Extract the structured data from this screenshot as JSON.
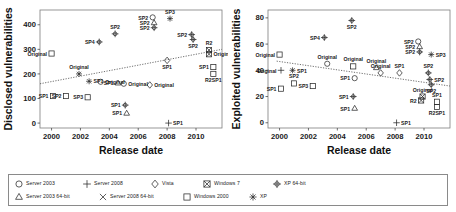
{
  "figure": {
    "panels": [
      {
        "id": "disclosed",
        "ylabel": "Disclosed vulnerabilities",
        "xlabel": "Release date",
        "xticks": [
          "2000",
          "2002",
          "2004",
          "2006",
          "2008",
          "2010"
        ],
        "yticks": [
          "0",
          "100",
          "200",
          "300",
          "400"
        ]
      },
      {
        "id": "exploited",
        "ylabel": "Exploited vulnerabilities",
        "xlabel": "Release date",
        "xticks": [
          "2000",
          "2002",
          "2004",
          "2006",
          "2008",
          "2010"
        ],
        "yticks": [
          "0",
          "20",
          "40",
          "60",
          "80"
        ]
      }
    ]
  },
  "legend": {
    "rows": [
      [
        {
          "label": "Server 2003",
          "marker": "circle"
        },
        {
          "label": "Server 2008",
          "marker": "plus"
        },
        {
          "label": "Vista",
          "marker": "diamond"
        },
        {
          "label": "Windows 7",
          "marker": "squarex"
        },
        {
          "label": "XP 64-bit",
          "marker": "circleplus"
        }
      ],
      [
        {
          "label": "Server 2003 64-bit",
          "marker": "triangle"
        },
        {
          "label": "Server 2008 64-bit",
          "marker": "cross"
        },
        {
          "label": "Windows 2000",
          "marker": "square"
        },
        {
          "label": "XP",
          "marker": "asterisk"
        }
      ]
    ]
  },
  "chart_data": [
    {
      "type": "scatter",
      "title": "",
      "xlabel": "Release date",
      "ylabel": "Disclosed vulnerabilities",
      "xlim": [
        1999.2,
        2011.8
      ],
      "ylim": [
        -20,
        460
      ],
      "grid": false,
      "legend_position": "below-figure",
      "trendline": {
        "x": [
          1999.2,
          2011.8
        ],
        "y": [
          160,
          300
        ],
        "style": "dotted"
      },
      "points": [
        {
          "x": 2000.0,
          "y": 283,
          "marker": "square",
          "label": "Original",
          "label_pos": "left"
        },
        {
          "x": 2001.9,
          "y": 200,
          "marker": "asterisk",
          "label": "Original",
          "label_pos": "above"
        },
        {
          "x": 2000.1,
          "y": 110,
          "marker": "square",
          "label": "SP1",
          "label_pos": "left"
        },
        {
          "x": 2001.0,
          "y": 110,
          "marker": "square",
          "label": "SP2",
          "label_pos": "left"
        },
        {
          "x": 2002.6,
          "y": 170,
          "marker": "asterisk",
          "label": "SP1",
          "label_pos": "right"
        },
        {
          "x": 2002.5,
          "y": 105,
          "marker": "square",
          "label": "SP3",
          "label_pos": "left"
        },
        {
          "x": 2003.4,
          "y": 168,
          "marker": "circle",
          "label": "Original",
          "label_pos": "right"
        },
        {
          "x": 2003.3,
          "y": 330,
          "marker": "circleplus",
          "label": "SP4",
          "label_pos": "left"
        },
        {
          "x": 2004.4,
          "y": 363,
          "marker": "circleplus",
          "label": "SP2",
          "label_pos": "above"
        },
        {
          "x": 2004.6,
          "y": 163,
          "marker": "triangle",
          "label": "SP1",
          "label_pos": "left"
        },
        {
          "x": 2005.0,
          "y": 160,
          "marker": "circle",
          "label": "Original",
          "label_pos": "right"
        },
        {
          "x": 2005.1,
          "y": 73,
          "marker": "circleplus",
          "label": "SP1",
          "label_pos": "left"
        },
        {
          "x": 2005.2,
          "y": 40,
          "marker": "triangle",
          "label": "SP1",
          "label_pos": "left"
        },
        {
          "x": 2006.8,
          "y": 155,
          "marker": "diamond",
          "label": "Original",
          "label_pos": "right"
        },
        {
          "x": 2007.0,
          "y": 430,
          "marker": "circle",
          "label": "SP2",
          "label_pos": "left"
        },
        {
          "x": 2007.1,
          "y": 408,
          "marker": "triangle",
          "label": "SP2",
          "label_pos": "left"
        },
        {
          "x": 2007.1,
          "y": 388,
          "marker": "circleplus",
          "label": "SP2",
          "label_pos": "left"
        },
        {
          "x": 2008.2,
          "y": 425,
          "marker": "asterisk",
          "label": "SP3",
          "label_pos": "above"
        },
        {
          "x": 2008.0,
          "y": 255,
          "marker": "diamond",
          "label": "SP1",
          "label_pos": "below"
        },
        {
          "x": 2008.1,
          "y": 0,
          "marker": "plus",
          "label": "SP1",
          "label_pos": "right"
        },
        {
          "x": 2009.7,
          "y": 360,
          "marker": "circleplus",
          "label": "SP2",
          "label_pos": "left"
        },
        {
          "x": 2009.8,
          "y": 340,
          "marker": "circleplus",
          "label": "SP2",
          "label_pos": "below"
        },
        {
          "x": 2010.9,
          "y": 280,
          "marker": "squarex",
          "label": "Original",
          "label_pos": "right"
        },
        {
          "x": 2010.9,
          "y": 297,
          "marker": "squarex",
          "label": "R2",
          "label_pos": "above"
        },
        {
          "x": 2011.2,
          "y": 228,
          "marker": "square",
          "label": "SP1",
          "label_pos": "left"
        },
        {
          "x": 2011.2,
          "y": 200,
          "marker": "square",
          "label": "R2SP1",
          "label_pos": "below"
        }
      ]
    },
    {
      "type": "scatter",
      "title": "",
      "xlabel": "Release date",
      "ylabel": "Exploited vulnerabilities",
      "xlim": [
        1999.2,
        2011.8
      ],
      "ylim": [
        -4,
        86
      ],
      "grid": false,
      "legend_position": "below-figure",
      "trendline": {
        "x": [
          1999.8,
          2011.8
        ],
        "y": [
          47,
          28
        ],
        "style": "dotted"
      },
      "points": [
        {
          "x": 2000.0,
          "y": 52,
          "marker": "square",
          "label": "Original",
          "label_pos": "left"
        },
        {
          "x": 2000.1,
          "y": 40,
          "marker": "plus",
          "label": "Original",
          "label_pos": "left"
        },
        {
          "x": 2000.9,
          "y": 40,
          "marker": "asterisk",
          "label": "SP1",
          "label_pos": "right"
        },
        {
          "x": 2000.1,
          "y": 26,
          "marker": "square",
          "label": "SP1",
          "label_pos": "left"
        },
        {
          "x": 2001.0,
          "y": 30,
          "marker": "square",
          "label": "SP2",
          "label_pos": "above"
        },
        {
          "x": 2002.3,
          "y": 28,
          "marker": "square",
          "label": "SP3",
          "label_pos": "left"
        },
        {
          "x": 2003.3,
          "y": 45,
          "marker": "circle",
          "label": "Original",
          "label_pos": "above"
        },
        {
          "x": 2003.1,
          "y": 65,
          "marker": "circleplus",
          "label": "SP4",
          "label_pos": "left"
        },
        {
          "x": 2005.1,
          "y": 43,
          "marker": "square",
          "label": "Original",
          "label_pos": "above"
        },
        {
          "x": 2005.0,
          "y": 78,
          "marker": "circleplus",
          "label": "SP2",
          "label_pos": "below"
        },
        {
          "x": 2005.2,
          "y": 34,
          "marker": "circle",
          "label": "SP1",
          "label_pos": "left"
        },
        {
          "x": 2005.1,
          "y": 20,
          "marker": "circleplus",
          "label": "SP1",
          "label_pos": "left"
        },
        {
          "x": 2005.2,
          "y": 11,
          "marker": "triangle",
          "label": "SP1",
          "label_pos": "left"
        },
        {
          "x": 2006.7,
          "y": 42,
          "marker": "triangle",
          "label": "Original",
          "label_pos": "above"
        },
        {
          "x": 2007.0,
          "y": 38,
          "marker": "diamond",
          "label": "Original",
          "label_pos": "above"
        },
        {
          "x": 2008.1,
          "y": 0,
          "marker": "plus",
          "label": "SP1",
          "label_pos": "right"
        },
        {
          "x": 2008.3,
          "y": 38,
          "marker": "diamond",
          "label": "SP1",
          "label_pos": "above"
        },
        {
          "x": 2009.6,
          "y": 62,
          "marker": "circle",
          "label": "SP2",
          "label_pos": "left"
        },
        {
          "x": 2009.7,
          "y": 58,
          "marker": "triangle",
          "label": "SP2",
          "label_pos": "left"
        },
        {
          "x": 2009.7,
          "y": 54,
          "marker": "circleplus",
          "label": "SP2",
          "label_pos": "left"
        },
        {
          "x": 2010.5,
          "y": 52,
          "marker": "asterisk",
          "label": "SP3",
          "label_pos": "right"
        },
        {
          "x": 2010.3,
          "y": 38,
          "marker": "circleplus",
          "label": "SP2",
          "label_pos": "above"
        },
        {
          "x": 2010.4,
          "y": 33,
          "marker": "circleplus",
          "label": "SP2",
          "label_pos": "right"
        },
        {
          "x": 2010.5,
          "y": 29,
          "marker": "circleplus",
          "label": "SP2",
          "label_pos": "below"
        },
        {
          "x": 2009.9,
          "y": 20,
          "marker": "squarex",
          "label": "Original",
          "label_pos": "above"
        },
        {
          "x": 2009.8,
          "y": 17,
          "marker": "squarex",
          "label": "R2",
          "label_pos": "left"
        },
        {
          "x": 2010.9,
          "y": 16,
          "marker": "square",
          "label": "SP1",
          "label_pos": "above"
        },
        {
          "x": 2010.9,
          "y": 12,
          "marker": "square",
          "label": "R2SP1",
          "label_pos": "below"
        }
      ]
    }
  ]
}
